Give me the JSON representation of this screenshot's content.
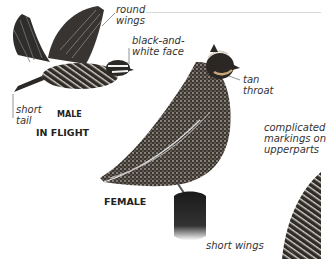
{
  "page": {
    "type": "field-guide-illustration",
    "subject_views": [
      {
        "id": "male-in-flight",
        "caption": "IN FLIGHT",
        "sex_label": "MALE"
      },
      {
        "id": "female-perched",
        "caption": "FEMALE"
      },
      {
        "id": "closeup-partial"
      }
    ],
    "annotations": {
      "round_wings": [
        "round",
        "wings"
      ],
      "black_white_face": [
        "black-and-",
        "white face"
      ],
      "short_tail": [
        "short",
        "tail"
      ],
      "tan_throat": [
        "tan",
        "throat"
      ],
      "complicated_markings": [
        "complicated",
        "markings on",
        "upperparts"
      ],
      "short_wings": "short wings"
    },
    "colors": {
      "background": "#ffffff",
      "ink": "#2a2a2a",
      "label_text": "#333333",
      "leader_line": "#666666",
      "rule": "#d8d8d8"
    }
  }
}
